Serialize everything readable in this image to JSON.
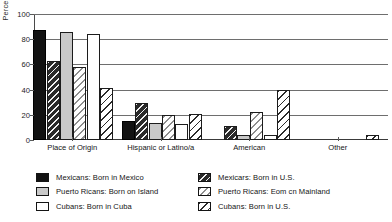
{
  "chart_data": {
    "type": "bar",
    "title": "",
    "xlabel": "",
    "ylabel": "Percentage",
    "ylim": [
      0,
      100
    ],
    "yticks": [
      0,
      20,
      40,
      60,
      80,
      100
    ],
    "grid": true,
    "legend_position": "bottom",
    "categories": [
      "Place of Origin",
      "Hispanic or Latino/a",
      "American",
      "Other"
    ],
    "series": [
      {
        "name": "Mexicans: Born in Mexico",
        "fill": "solid-black",
        "values": [
          87,
          15,
          0,
          0
        ]
      },
      {
        "name": "Mexicans: Born in U.S.",
        "fill": "hatch-dark",
        "values": [
          63,
          29,
          11,
          0
        ]
      },
      {
        "name": "Puerto Ricans: Born on Island",
        "fill": "solid-gray",
        "values": [
          85.5,
          13.5,
          4,
          0
        ]
      },
      {
        "name": "Puerto Ricans: Eom cn Mainland",
        "fill": "hatch-gray",
        "values": [
          58,
          20,
          22,
          0
        ]
      },
      {
        "name": "Cubans: Born in Cuba",
        "fill": "solid-white",
        "values": [
          84,
          13,
          4,
          0
        ]
      },
      {
        "name": "Cubans: Born in U.S.",
        "fill": "hatch-white",
        "values": [
          41,
          20.5,
          39.5,
          4
        ]
      }
    ]
  },
  "legend": {
    "left_column": [
      {
        "label": "Mexicans: Born in Mexico",
        "swatch": "solid-black"
      },
      {
        "label": "Puerto Ricans: Born on Island",
        "swatch": "solid-gray"
      },
      {
        "label": "Cubans: Born in Cuba",
        "swatch": "solid-white"
      }
    ],
    "right_column": [
      {
        "label": "Mexicars: Born in U.S.",
        "swatch": "hatch-dark"
      },
      {
        "label": "Puerto Ricans: Eom cn Mainland",
        "swatch": "hatch-gray"
      },
      {
        "label": "Cubans: Born in U.S.",
        "swatch": "hatch-white"
      }
    ]
  }
}
